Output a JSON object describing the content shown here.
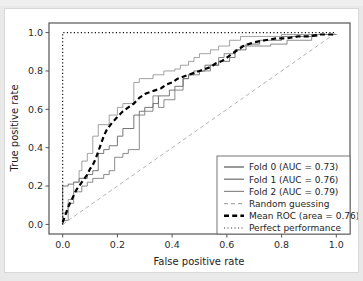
{
  "figure": {
    "background": "#ffffff",
    "border_color": "#d8d8d8",
    "outer_background": "#e9e9e9"
  },
  "chart_data": {
    "type": "line",
    "title": "",
    "xlabel": "False positive rate",
    "ylabel": "True positive rate",
    "xlim": [
      -0.05,
      1.05
    ],
    "ylim": [
      -0.05,
      1.05
    ],
    "xticks": [
      "0.0",
      "0.2",
      "0.4",
      "0.6",
      "0.8",
      "1.0"
    ],
    "xtick_values": [
      0.0,
      0.2,
      0.4,
      0.6,
      0.8,
      1.0
    ],
    "yticks": [
      "0.0",
      "0.2",
      "0.4",
      "0.6",
      "0.8",
      "1.0"
    ],
    "ytick_values": [
      0.0,
      0.2,
      0.4,
      0.6,
      0.8,
      1.0
    ],
    "grid": false,
    "legend_position": "lower right",
    "series": [
      {
        "name": "Fold 0 (AUC = 0.73)",
        "auc": 0.73,
        "color": "#555555",
        "linestyle": "solid",
        "linewidth": 0.8,
        "x": [
          0.0,
          0.0,
          0.02,
          0.02,
          0.04,
          0.04,
          0.06,
          0.06,
          0.09,
          0.09,
          0.11,
          0.11,
          0.13,
          0.13,
          0.15,
          0.15,
          0.17,
          0.17,
          0.2,
          0.2,
          0.22,
          0.22,
          0.26,
          0.26,
          0.28,
          0.28,
          0.3,
          0.3,
          0.33,
          0.33,
          0.35,
          0.35,
          0.39,
          0.39,
          0.41,
          0.41,
          0.44,
          0.44,
          0.46,
          0.46,
          0.48,
          0.48,
          0.52,
          0.52,
          0.57,
          0.57,
          0.61,
          0.61,
          0.63,
          0.63,
          0.67,
          0.67,
          0.72,
          0.72,
          0.8,
          0.8,
          0.87,
          0.87,
          0.93,
          0.93,
          1.0
        ],
        "y": [
          0.0,
          0.2,
          0.2,
          0.21,
          0.21,
          0.22,
          0.22,
          0.24,
          0.24,
          0.26,
          0.26,
          0.28,
          0.28,
          0.37,
          0.37,
          0.39,
          0.39,
          0.41,
          0.41,
          0.46,
          0.46,
          0.5,
          0.5,
          0.57,
          0.57,
          0.59,
          0.59,
          0.61,
          0.61,
          0.63,
          0.63,
          0.67,
          0.67,
          0.7,
          0.7,
          0.72,
          0.72,
          0.76,
          0.76,
          0.78,
          0.78,
          0.8,
          0.8,
          0.83,
          0.83,
          0.85,
          0.85,
          0.87,
          0.87,
          0.91,
          0.91,
          0.94,
          0.94,
          0.96,
          0.96,
          0.98,
          0.98,
          0.98,
          0.98,
          0.99,
          0.99
        ]
      },
      {
        "name": "Fold 1 (AUC = 0.76)",
        "auc": 0.76,
        "color": "#6e6e6e",
        "linestyle": "solid",
        "linewidth": 0.8,
        "x": [
          0.0,
          0.0,
          0.02,
          0.02,
          0.04,
          0.04,
          0.07,
          0.07,
          0.09,
          0.09,
          0.11,
          0.11,
          0.13,
          0.13,
          0.15,
          0.15,
          0.17,
          0.17,
          0.19,
          0.19,
          0.22,
          0.22,
          0.24,
          0.24,
          0.28,
          0.28,
          0.3,
          0.3,
          0.33,
          0.33,
          0.33,
          0.35,
          0.35,
          0.37,
          0.37,
          0.41,
          0.41,
          0.44,
          0.44,
          0.46,
          0.46,
          0.5,
          0.5,
          0.54,
          0.54,
          0.57,
          0.57,
          0.59,
          0.59,
          0.63,
          0.63,
          0.65,
          0.65,
          0.76,
          0.76,
          0.82,
          0.82,
          0.91,
          0.91,
          1.0
        ],
        "y": [
          0.0,
          0.02,
          0.02,
          0.11,
          0.11,
          0.17,
          0.17,
          0.2,
          0.2,
          0.22,
          0.22,
          0.24,
          0.24,
          0.24,
          0.24,
          0.26,
          0.26,
          0.28,
          0.28,
          0.35,
          0.35,
          0.37,
          0.37,
          0.39,
          0.39,
          0.57,
          0.57,
          0.59,
          0.59,
          0.61,
          0.67,
          0.67,
          0.61,
          0.61,
          0.65,
          0.65,
          0.7,
          0.7,
          0.76,
          0.76,
          0.78,
          0.78,
          0.8,
          0.8,
          0.83,
          0.83,
          0.87,
          0.87,
          0.89,
          0.89,
          0.91,
          0.91,
          0.93,
          0.93,
          0.94,
          0.94,
          0.96,
          0.96,
          0.99,
          0.99
        ]
      },
      {
        "name": "Fold 2 (AUC = 0.79)",
        "auc": 0.79,
        "color": "#8a8a8a",
        "linestyle": "solid",
        "linewidth": 0.8,
        "x": [
          0.0,
          0.0,
          0.02,
          0.02,
          0.04,
          0.04,
          0.06,
          0.06,
          0.07,
          0.07,
          0.09,
          0.09,
          0.11,
          0.11,
          0.13,
          0.13,
          0.17,
          0.17,
          0.2,
          0.2,
          0.22,
          0.22,
          0.26,
          0.26,
          0.28,
          0.28,
          0.33,
          0.33,
          0.35,
          0.35,
          0.37,
          0.37,
          0.41,
          0.41,
          0.43,
          0.43,
          0.46,
          0.46,
          0.48,
          0.48,
          0.5,
          0.5,
          0.54,
          0.54,
          0.57,
          0.57,
          0.61,
          0.61,
          0.65,
          0.65,
          0.72,
          0.72,
          0.8,
          0.8,
          0.89,
          0.89,
          1.0
        ],
        "y": [
          0.0,
          0.06,
          0.06,
          0.13,
          0.13,
          0.22,
          0.22,
          0.28,
          0.28,
          0.33,
          0.33,
          0.37,
          0.37,
          0.46,
          0.46,
          0.52,
          0.52,
          0.57,
          0.57,
          0.61,
          0.61,
          0.63,
          0.63,
          0.74,
          0.74,
          0.76,
          0.76,
          0.78,
          0.78,
          0.78,
          0.78,
          0.8,
          0.8,
          0.81,
          0.81,
          0.83,
          0.83,
          0.85,
          0.85,
          0.87,
          0.87,
          0.89,
          0.89,
          0.91,
          0.91,
          0.93,
          0.93,
          0.96,
          0.96,
          0.98,
          0.98,
          0.98,
          0.98,
          0.99,
          0.99,
          0.99,
          0.99
        ]
      },
      {
        "name": "Random guessing",
        "color": "#aaaaaa",
        "linestyle": "dashed",
        "linewidth": 0.9,
        "x": [
          0.0,
          1.0
        ],
        "y": [
          0.0,
          1.0
        ]
      },
      {
        "name": "Mean ROC (area = 0.76)",
        "auc": 0.76,
        "color": "#000000",
        "linestyle": "dashed",
        "linewidth": 2.2,
        "x": [
          0.0,
          0.01,
          0.02,
          0.03,
          0.04,
          0.05,
          0.06,
          0.07,
          0.08,
          0.09,
          0.1,
          0.11,
          0.12,
          0.13,
          0.14,
          0.15,
          0.16,
          0.18,
          0.2,
          0.22,
          0.24,
          0.26,
          0.28,
          0.3,
          0.32,
          0.34,
          0.36,
          0.38,
          0.4,
          0.42,
          0.44,
          0.46,
          0.48,
          0.5,
          0.52,
          0.54,
          0.56,
          0.58,
          0.6,
          0.62,
          0.64,
          0.66,
          0.7,
          0.74,
          0.78,
          0.82,
          0.86,
          0.9,
          0.94,
          1.0
        ],
        "y": [
          0.01,
          0.05,
          0.09,
          0.12,
          0.15,
          0.18,
          0.2,
          0.22,
          0.24,
          0.26,
          0.29,
          0.31,
          0.34,
          0.38,
          0.42,
          0.46,
          0.49,
          0.53,
          0.56,
          0.59,
          0.61,
          0.63,
          0.66,
          0.68,
          0.69,
          0.7,
          0.71,
          0.73,
          0.74,
          0.76,
          0.77,
          0.78,
          0.79,
          0.8,
          0.81,
          0.82,
          0.84,
          0.85,
          0.87,
          0.89,
          0.91,
          0.93,
          0.95,
          0.96,
          0.97,
          0.97,
          0.98,
          0.98,
          0.99,
          0.99
        ]
      },
      {
        "name": "Perfect performance",
        "color": "#000000",
        "linestyle": "dotted",
        "linewidth": 1.1,
        "x": [
          0.0,
          0.0,
          1.0
        ],
        "y": [
          0.0,
          1.0,
          1.0
        ]
      }
    ],
    "legend": [
      {
        "label": "Fold 0 (AUC = 0.73)",
        "color": "#555555",
        "style": "solid",
        "width": 1.2
      },
      {
        "label": "Fold 1 (AUC = 0.76)",
        "color": "#6e6e6e",
        "style": "solid",
        "width": 1.2
      },
      {
        "label": "Fold 2 (AUC = 0.79)",
        "color": "#8a8a8a",
        "style": "solid",
        "width": 1.2
      },
      {
        "label": "Random guessing",
        "color": "#aaaaaa",
        "style": "dashed",
        "width": 1.1
      },
      {
        "label": "Mean ROC (area = 0.76)",
        "color": "#000000",
        "style": "dashed",
        "width": 2.4
      },
      {
        "label": "Perfect performance",
        "color": "#333333",
        "style": "dotted",
        "width": 1.1
      }
    ]
  }
}
